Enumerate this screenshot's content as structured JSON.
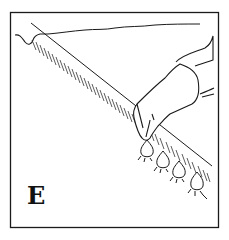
{
  "figure": {
    "panel_label": "E",
    "colors": {
      "ink": "#1a1a1a",
      "background": "#ffffff"
    },
    "bulbs": [
      {
        "cx": 147,
        "cy": 150
      },
      {
        "cx": 163,
        "cy": 161
      },
      {
        "cx": 179,
        "cy": 171
      },
      {
        "cx": 197,
        "cy": 183
      }
    ]
  }
}
